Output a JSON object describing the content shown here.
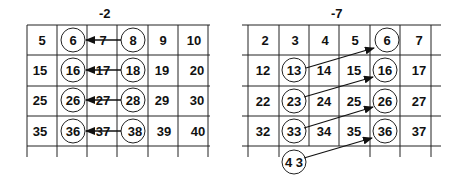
{
  "diagrams": [
    {
      "title": "-2",
      "grid": [
        [
          "5",
          "6",
          "7",
          "8",
          "9",
          "10"
        ],
        [
          "15",
          "16",
          "17",
          "18",
          "19",
          "20"
        ],
        [
          "25",
          "26",
          "27",
          "28",
          "29",
          "30"
        ],
        [
          "35",
          "36",
          "37",
          "38",
          "39",
          "40"
        ]
      ],
      "circled": [
        "6",
        "8",
        "16",
        "18",
        "26",
        "28",
        "36",
        "38"
      ],
      "arrows": [
        {
          "from": "8",
          "to": "6"
        },
        {
          "from": "18",
          "to": "16"
        },
        {
          "from": "28",
          "to": "26"
        },
        {
          "from": "38",
          "to": "36"
        }
      ]
    },
    {
      "title": "-7",
      "grid": [
        [
          "2",
          "3",
          "4",
          "5",
          "6",
          "7"
        ],
        [
          "12",
          "13",
          "14",
          "15",
          "16",
          "17"
        ],
        [
          "22",
          "23",
          "24",
          "25",
          "26",
          "27"
        ],
        [
          "32",
          "33",
          "34",
          "35",
          "36",
          "37"
        ]
      ],
      "extra_below": "4 3",
      "circled": [
        "6",
        "13",
        "16",
        "23",
        "26",
        "33",
        "36",
        "43"
      ],
      "arrows": [
        {
          "from": "13",
          "to": "6"
        },
        {
          "from": "23",
          "to": "16"
        },
        {
          "from": "33",
          "to": "26"
        },
        {
          "from": "43",
          "to": "36"
        }
      ]
    }
  ],
  "colors": {
    "line": "#222222",
    "text": "#111111",
    "background": "#ffffff"
  }
}
